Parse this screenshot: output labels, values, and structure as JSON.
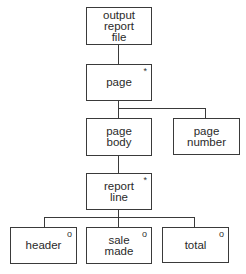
{
  "diagram": {
    "type": "jackson-structure-diagram",
    "nodes": [
      {
        "id": "output-report-file",
        "label": "output\nreport\nfile",
        "marker": ""
      },
      {
        "id": "page",
        "label": "page",
        "marker": "*"
      },
      {
        "id": "page-body",
        "label": "page\nbody",
        "marker": ""
      },
      {
        "id": "page-number",
        "label": "page\nnumber",
        "marker": ""
      },
      {
        "id": "report-line",
        "label": "report\nline",
        "marker": "*"
      },
      {
        "id": "header",
        "label": "header",
        "marker": "o"
      },
      {
        "id": "sale-made",
        "label": "sale\nmade",
        "marker": "o"
      },
      {
        "id": "total",
        "label": "total",
        "marker": "o"
      }
    ],
    "edges": [
      [
        "output-report-file",
        "page"
      ],
      [
        "page",
        "page-body"
      ],
      [
        "page",
        "page-number"
      ],
      [
        "page-body",
        "report-line"
      ],
      [
        "report-line",
        "header"
      ],
      [
        "report-line",
        "sale-made"
      ],
      [
        "report-line",
        "total"
      ]
    ]
  }
}
